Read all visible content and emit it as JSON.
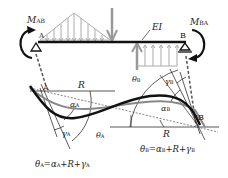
{
  "diagram": {
    "type": "beam slope-deflection diagram",
    "beam": {
      "stiffness_label": "EI",
      "support_left": "A",
      "support_right": "B"
    },
    "moments": {
      "left": {
        "symbol": "M",
        "subscript": "AB"
      },
      "right": {
        "symbol": "M",
        "subscript": "BA"
      }
    },
    "deflected_shape": {
      "chord_rotation_label": "R",
      "left_angles": {
        "alpha": {
          "symbol": "α",
          "subscript": "A"
        },
        "gamma": {
          "symbol": "γ",
          "subscript": "A"
        },
        "theta": {
          "symbol": "θ",
          "subscript": "A"
        },
        "node": "A",
        "R": "R"
      },
      "right_angles": {
        "alpha": {
          "symbol": "α",
          "subscript": "B"
        },
        "gamma": {
          "symbol": "γ",
          "subscript": "B"
        },
        "theta": {
          "symbol": "θ",
          "subscript": "B"
        },
        "node": "B",
        "R": "R"
      }
    },
    "equations": {
      "left": {
        "lhs": "θ",
        "lhs_sub": "A",
        "eq": "=",
        "a": "α",
        "a_sub": "A",
        "plus1": "+",
        "r": "R",
        "plus2": "+",
        "g": "γ",
        "g_sub": "A"
      },
      "right": {
        "lhs": "θ",
        "lhs_sub": "B",
        "eq": "=",
        "a": "α",
        "a_sub": "B",
        "plus1": "+",
        "r": "R",
        "plus2": "+",
        "g": "γ",
        "g_sub": "B"
      }
    },
    "colors": {
      "beam": "#111111",
      "load": "#999999",
      "curve_main": "#111111",
      "curve_secondary": "#888888",
      "construction": "#333333"
    }
  }
}
